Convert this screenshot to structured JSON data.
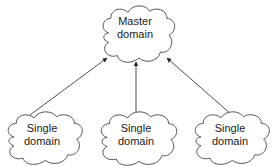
{
  "diagram": {
    "master": {
      "line1": "Master",
      "line2": "domain"
    },
    "children": [
      {
        "line1": "Single",
        "line2": "domain"
      },
      {
        "line1": "Single",
        "line2": "domain"
      },
      {
        "line1": "Single",
        "line2": "domain"
      }
    ],
    "colors": {
      "stroke": "#333333",
      "fill": "#ffffff",
      "text": "#222222"
    }
  }
}
